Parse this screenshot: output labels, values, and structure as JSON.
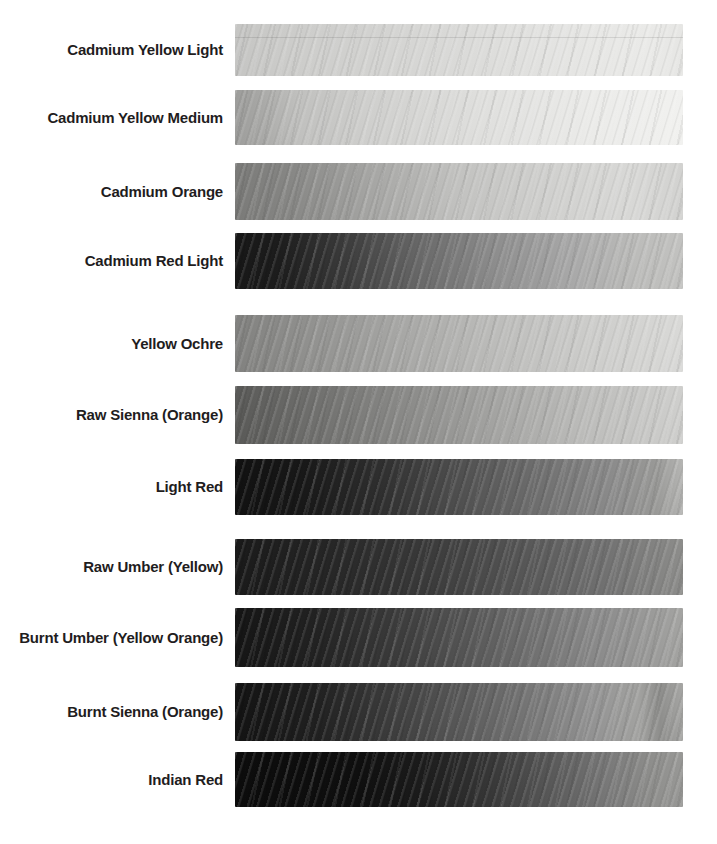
{
  "colors": {
    "page_background": "#ffffff",
    "label_text": "#1f1d1e"
  },
  "rows": [
    {
      "label": "Cadmium Yellow Light",
      "value_gradient": [
        {
          "pos": 0,
          "color": "#c5c5c3"
        },
        {
          "pos": 10,
          "color": "#cbcbc9"
        },
        {
          "pos": 30,
          "color": "#d2d2d0"
        },
        {
          "pos": 55,
          "color": "#dcdcda"
        },
        {
          "pos": 75,
          "color": "#e5e5e3"
        },
        {
          "pos": 92,
          "color": "#eaeae8"
        },
        {
          "pos": 100,
          "color": "#e6e6e4"
        }
      ]
    },
    {
      "label": "Cadmium Yellow Medium",
      "value_gradient": [
        {
          "pos": 0,
          "color": "#9d9d9b"
        },
        {
          "pos": 5,
          "color": "#a6a6a4"
        },
        {
          "pos": 14,
          "color": "#c0c0be"
        },
        {
          "pos": 30,
          "color": "#cfcfcd"
        },
        {
          "pos": 55,
          "color": "#dfdfdd"
        },
        {
          "pos": 80,
          "color": "#ebebe9"
        },
        {
          "pos": 100,
          "color": "#f1f1ef"
        }
      ]
    },
    {
      "label": "Cadmium Orange",
      "value_gradient": [
        {
          "pos": 0,
          "color": "#7a7a78"
        },
        {
          "pos": 12,
          "color": "#868684"
        },
        {
          "pos": 30,
          "color": "#a5a5a3"
        },
        {
          "pos": 50,
          "color": "#c2c2c0"
        },
        {
          "pos": 70,
          "color": "#d0d0ce"
        },
        {
          "pos": 88,
          "color": "#d8d8d6"
        },
        {
          "pos": 100,
          "color": "#d2d2d0"
        }
      ]
    },
    {
      "label": "Cadmium Red Light",
      "value_gradient": [
        {
          "pos": 0,
          "color": "#171717"
        },
        {
          "pos": 10,
          "color": "#1d1d1d"
        },
        {
          "pos": 25,
          "color": "#3c3c3c"
        },
        {
          "pos": 42,
          "color": "#6a6a6a"
        },
        {
          "pos": 58,
          "color": "#8d8d8d"
        },
        {
          "pos": 75,
          "color": "#a8a8a8"
        },
        {
          "pos": 90,
          "color": "#bcbcba"
        },
        {
          "pos": 100,
          "color": "#c2c2c0"
        }
      ]
    },
    {
      "label": "Yellow Ochre",
      "value_gradient": [
        {
          "pos": 0,
          "color": "#81817f"
        },
        {
          "pos": 15,
          "color": "#8f8f8d"
        },
        {
          "pos": 35,
          "color": "#a5a5a3"
        },
        {
          "pos": 58,
          "color": "#bcbcba"
        },
        {
          "pos": 80,
          "color": "#cdcdcb"
        },
        {
          "pos": 100,
          "color": "#d9d9d7"
        }
      ]
    },
    {
      "label": "Raw Sienna (Orange)",
      "value_gradient": [
        {
          "pos": 0,
          "color": "#595957"
        },
        {
          "pos": 12,
          "color": "#686866"
        },
        {
          "pos": 32,
          "color": "#828280"
        },
        {
          "pos": 55,
          "color": "#a0a09e"
        },
        {
          "pos": 78,
          "color": "#bcbcba"
        },
        {
          "pos": 100,
          "color": "#cfcfcd"
        }
      ]
    },
    {
      "label": "Light Red",
      "value_gradient": [
        {
          "pos": 0,
          "color": "#111111"
        },
        {
          "pos": 15,
          "color": "#181818"
        },
        {
          "pos": 32,
          "color": "#2e2e2e"
        },
        {
          "pos": 50,
          "color": "#4f4f4f"
        },
        {
          "pos": 68,
          "color": "#6f6f6f"
        },
        {
          "pos": 84,
          "color": "#8b8b8b"
        },
        {
          "pos": 94,
          "color": "#999997"
        },
        {
          "pos": 100,
          "color": "#b5b5b3"
        }
      ]
    },
    {
      "label": "Raw Umber (Yellow)",
      "value_gradient": [
        {
          "pos": 0,
          "color": "#1a1a1a"
        },
        {
          "pos": 20,
          "color": "#252525"
        },
        {
          "pos": 42,
          "color": "#393939"
        },
        {
          "pos": 62,
          "color": "#535353"
        },
        {
          "pos": 82,
          "color": "#707070"
        },
        {
          "pos": 100,
          "color": "#8d8d8b"
        }
      ]
    },
    {
      "label": "Burnt Umber (Yellow Orange)",
      "value_gradient": [
        {
          "pos": 0,
          "color": "#151515"
        },
        {
          "pos": 18,
          "color": "#222222"
        },
        {
          "pos": 40,
          "color": "#414141"
        },
        {
          "pos": 62,
          "color": "#686868"
        },
        {
          "pos": 82,
          "color": "#8c8c8c"
        },
        {
          "pos": 100,
          "color": "#a4a4a2"
        }
      ]
    },
    {
      "label": "Burnt Sienna (Orange)",
      "value_gradient": [
        {
          "pos": 0,
          "color": "#131313"
        },
        {
          "pos": 18,
          "color": "#202020"
        },
        {
          "pos": 40,
          "color": "#454545"
        },
        {
          "pos": 62,
          "color": "#6f6f6f"
        },
        {
          "pos": 80,
          "color": "#939393"
        },
        {
          "pos": 90,
          "color": "#a2a2a0"
        },
        {
          "pos": 95,
          "color": "#8e8e8c"
        },
        {
          "pos": 100,
          "color": "#a6a6a4"
        }
      ]
    },
    {
      "label": "Indian Red",
      "value_gradient": [
        {
          "pos": 0,
          "color": "#0c0c0c"
        },
        {
          "pos": 28,
          "color": "#0f0f0f"
        },
        {
          "pos": 42,
          "color": "#1c1c1c"
        },
        {
          "pos": 57,
          "color": "#373737"
        },
        {
          "pos": 70,
          "color": "#575757"
        },
        {
          "pos": 83,
          "color": "#787878"
        },
        {
          "pos": 93,
          "color": "#8e8e8c"
        },
        {
          "pos": 100,
          "color": "#989896"
        }
      ]
    }
  ]
}
